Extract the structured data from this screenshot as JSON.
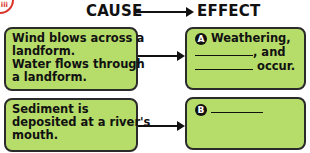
{
  "header": {
    "cause_label": "CAUSE",
    "effect_label": "EFFECT",
    "logo_text": "iii"
  },
  "causes": [
    {
      "lines": [
        "Wind blows across a",
        "landform.",
        "Water flows through",
        "a landform."
      ]
    },
    {
      "lines": [
        "Sediment is",
        "deposited at a river's",
        "mouth."
      ]
    }
  ],
  "effects": [
    {
      "badge": "A",
      "lines": [
        "Weathering,",
        ", and",
        "occur."
      ]
    },
    {
      "badge": "B",
      "lines": [
        ""
      ]
    }
  ],
  "colors": {
    "box_fill": "#b6dc6a",
    "box_border": "#2b2b2b",
    "logo_red": "#d9342b"
  }
}
